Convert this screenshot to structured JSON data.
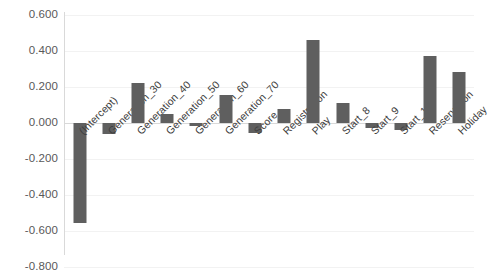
{
  "chart_data": {
    "type": "bar",
    "title": "",
    "subtitle": "",
    "xlabel": "",
    "ylabel": "",
    "ylim": [
      -0.8,
      0.6
    ],
    "ytick_labels": [
      "0.600",
      "0.400",
      "0.200",
      "0.000",
      "-0.200",
      "-0.400",
      "-0.600",
      "-0.800"
    ],
    "ytick_values": [
      0.6,
      0.4,
      0.2,
      0.0,
      -0.2,
      -0.4,
      -0.6,
      -0.8
    ],
    "grid": true,
    "legend": false,
    "legend_position": "none",
    "bar_color": "#5f5f5f",
    "gridline_color": "#f2f2f2",
    "axis_color": "#d9d9d9",
    "categories": [
      "(Intercept)",
      "Generation_30",
      "Generation_40",
      "Generation_50",
      "Generation_60",
      "Generation_70",
      "Score",
      "Registration",
      "Play",
      "Start_8",
      "Start_9",
      "Start_10",
      "Reservation",
      "Holiday"
    ],
    "values": [
      -0.555,
      -0.06,
      0.222,
      0.048,
      -0.018,
      0.155,
      -0.058,
      0.078,
      0.46,
      0.11,
      -0.03,
      -0.04,
      0.372,
      0.283
    ]
  }
}
